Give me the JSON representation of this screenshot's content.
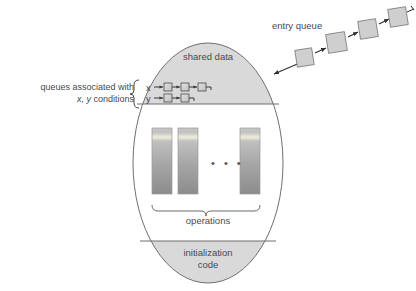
{
  "diagram": {
    "monitor": {
      "shared_data_label": "shared data",
      "initialization_label_line1": "initialization",
      "initialization_label_line2": "code",
      "operations_label": "operations",
      "operation_count": 3,
      "ellipsis": "• • •"
    },
    "condition_queues": {
      "caption_line1": "queues associated with",
      "caption_line2_italic": "x, y",
      "caption_line2_rest": " conditions",
      "rows": [
        {
          "name": "x",
          "node_count": 3
        },
        {
          "name": "y",
          "node_count": 2
        }
      ]
    },
    "entry_queue": {
      "label": "entry queue",
      "node_count": 4
    },
    "colors": {
      "shape_stroke": "#6f6f6f",
      "shaded_fill": "#d9d9d9",
      "node_fill": "#cfcfcf",
      "op_top": "#c9c9c9",
      "op_bottom": "#8f8f8f",
      "op_stripe": "#efeedd",
      "text": "#4a4a4a",
      "background": "#ffffff"
    }
  }
}
